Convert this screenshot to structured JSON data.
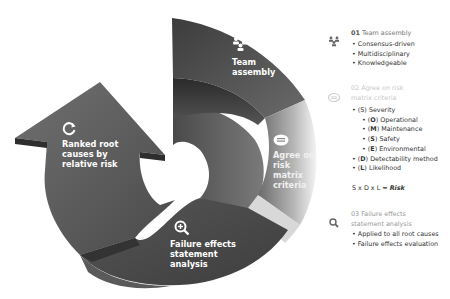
{
  "diagram": {
    "segments": [
      {
        "id": "team",
        "icon": "team-icon",
        "label_lines": [
          "Team",
          "assembly"
        ]
      },
      {
        "id": "agree",
        "icon": "chat-icon",
        "label_lines": [
          "Agree on",
          "risk matrix",
          "criteria"
        ]
      },
      {
        "id": "failure",
        "icon": "magnifier-plus-icon",
        "label_lines": [
          "Failure effects",
          "statement",
          "analysis"
        ]
      },
      {
        "id": "ranked",
        "icon": "refresh-icon",
        "label_lines": [
          "Ranked root",
          "causes by",
          "relative risk"
        ]
      }
    ],
    "colors": {
      "dark": "#3a3a3a",
      "mid": "#6b6b6b",
      "light": "#bdbdbd",
      "faded": "#e6e6e6"
    }
  },
  "legend": {
    "step1": {
      "number": "01",
      "title": "Team assembly",
      "items": [
        "Consensus-driven",
        "Multidisciplinary",
        "Knowledgeable"
      ]
    },
    "step2": {
      "number": "02",
      "title_line1": "Agree on risk",
      "title_line2": "matrix criteria",
      "items": [
        {
          "prefix": "(S)",
          "text": "Severity",
          "level": 0,
          "bold_letter": false
        },
        {
          "letter": "O",
          "text": "Operational",
          "level": 1
        },
        {
          "letter": "M",
          "text": "Maintenance",
          "level": 1
        },
        {
          "letter": "S",
          "text": "Safety",
          "level": 1
        },
        {
          "letter": "E",
          "text": "Environmental",
          "level": 1
        },
        {
          "letter": "D",
          "text": "Detectability method",
          "level": 0
        },
        {
          "letter": "L",
          "text": "Likelihood",
          "level": 0
        }
      ],
      "formula_prefix": "S x D x L = ",
      "formula_result": "Risk"
    },
    "step3": {
      "number": "03",
      "title_line1": "Failure effects",
      "title_line2": "statement  analysis",
      "items": [
        "Applied to all root causes",
        "Failure effects evaluation"
      ]
    }
  }
}
